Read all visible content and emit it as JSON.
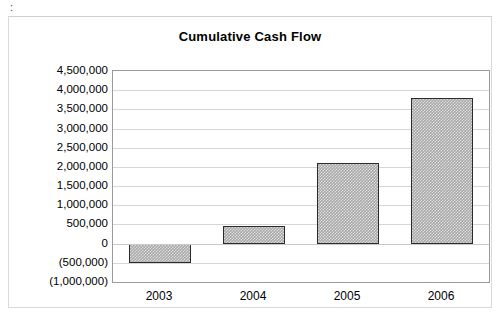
{
  "chart_data": {
    "type": "bar",
    "title": "Cumulative Cash Flow",
    "xlabel": "",
    "ylabel": "",
    "categories": [
      "2003",
      "2004",
      "2005",
      "2006"
    ],
    "values": [
      -500000,
      450000,
      2100000,
      3800000
    ],
    "value_labels": [
      "(500,000)",
      "450,000",
      "2,100,000",
      "3,800,000"
    ],
    "ylim": [
      -1000000,
      4500000
    ],
    "ytick_values": [
      4500000,
      4000000,
      3500000,
      3000000,
      2500000,
      2000000,
      1500000,
      1000000,
      500000,
      0,
      -500000,
      -1000000
    ],
    "ytick_labels": [
      "4,500,000",
      "4,000,000",
      "3,500,000",
      "3,000,000",
      "2,500,000",
      "2,000,000",
      "1,500,000",
      "1,000,000",
      "500,000",
      "0",
      "(500,000)",
      "(1,000,000)"
    ],
    "grid": true,
    "legend": false,
    "legend_position": "none",
    "bar_fill_color": "#a9a9a9",
    "bar_border_color": "#2b2b2b",
    "gridline_color": "#d6d6d6",
    "axis_color": "#9a9a9a",
    "background_color": "#ffffff",
    "negative_format": "parentheses"
  },
  "artifact": {
    "mark": ":"
  }
}
